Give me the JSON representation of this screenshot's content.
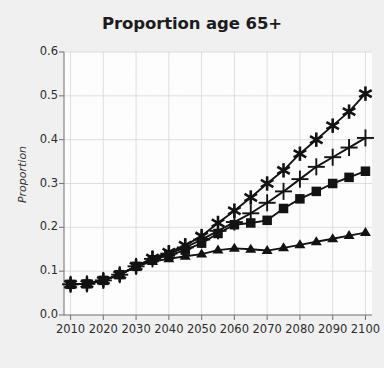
{
  "chart_data": {
    "type": "line",
    "title": "Proportion age 65+",
    "xlabel": "",
    "ylabel": "Proportion",
    "xlim": [
      2008,
      2102
    ],
    "ylim": [
      0.0,
      0.6
    ],
    "grid": true,
    "legend": "none",
    "yticks": [
      "0.0",
      "0.1",
      "0.2",
      "0.3",
      "0.4",
      "0.5",
      "0.6"
    ],
    "ytick_values": [
      0.0,
      0.1,
      0.2,
      0.3,
      0.4,
      0.5,
      0.6
    ],
    "xticks": [
      "2010",
      "2020",
      "2030",
      "2040",
      "2050",
      "2060",
      "2070",
      "2080",
      "2090",
      "2100"
    ],
    "xtick_values": [
      2010,
      2020,
      2030,
      2040,
      2050,
      2060,
      2070,
      2080,
      2090,
      2100
    ],
    "x": [
      2010,
      2015,
      2020,
      2025,
      2030,
      2035,
      2040,
      2045,
      2050,
      2055,
      2060,
      2065,
      2070,
      2075,
      2080,
      2085,
      2090,
      2095,
      2100
    ],
    "series": [
      {
        "name": "series-star",
        "marker": "star",
        "color": "#111111",
        "values": [
          0.07,
          0.071,
          0.079,
          0.092,
          0.111,
          0.13,
          0.143,
          0.159,
          0.18,
          0.21,
          0.238,
          0.268,
          0.3,
          0.33,
          0.368,
          0.4,
          0.432,
          0.464,
          0.505
        ]
      },
      {
        "name": "series-plus",
        "marker": "plus",
        "color": "#111111",
        "values": [
          0.07,
          0.071,
          0.079,
          0.092,
          0.111,
          0.128,
          0.14,
          0.154,
          0.172,
          0.192,
          0.212,
          0.232,
          0.256,
          0.282,
          0.31,
          0.338,
          0.36,
          0.382,
          0.404
        ]
      },
      {
        "name": "series-square",
        "marker": "square",
        "color": "#111111",
        "values": [
          0.07,
          0.071,
          0.079,
          0.092,
          0.111,
          0.126,
          0.136,
          0.148,
          0.164,
          0.186,
          0.206,
          0.21,
          0.216,
          0.243,
          0.265,
          0.282,
          0.3,
          0.314,
          0.328
        ]
      },
      {
        "name": "series-triangle",
        "marker": "triangle",
        "color": "#111111",
        "values": [
          0.07,
          0.071,
          0.079,
          0.092,
          0.111,
          0.122,
          0.128,
          0.134,
          0.139,
          0.148,
          0.152,
          0.15,
          0.147,
          0.153,
          0.16,
          0.167,
          0.174,
          0.181,
          0.188
        ]
      }
    ]
  },
  "colors": {
    "figure_background": "#f2f2f2",
    "plot_background": "#ffffff",
    "grid": "#d8d8d8",
    "axis": "#7a7a7a",
    "ink": "#111111",
    "text": "#2b2b2b"
  }
}
